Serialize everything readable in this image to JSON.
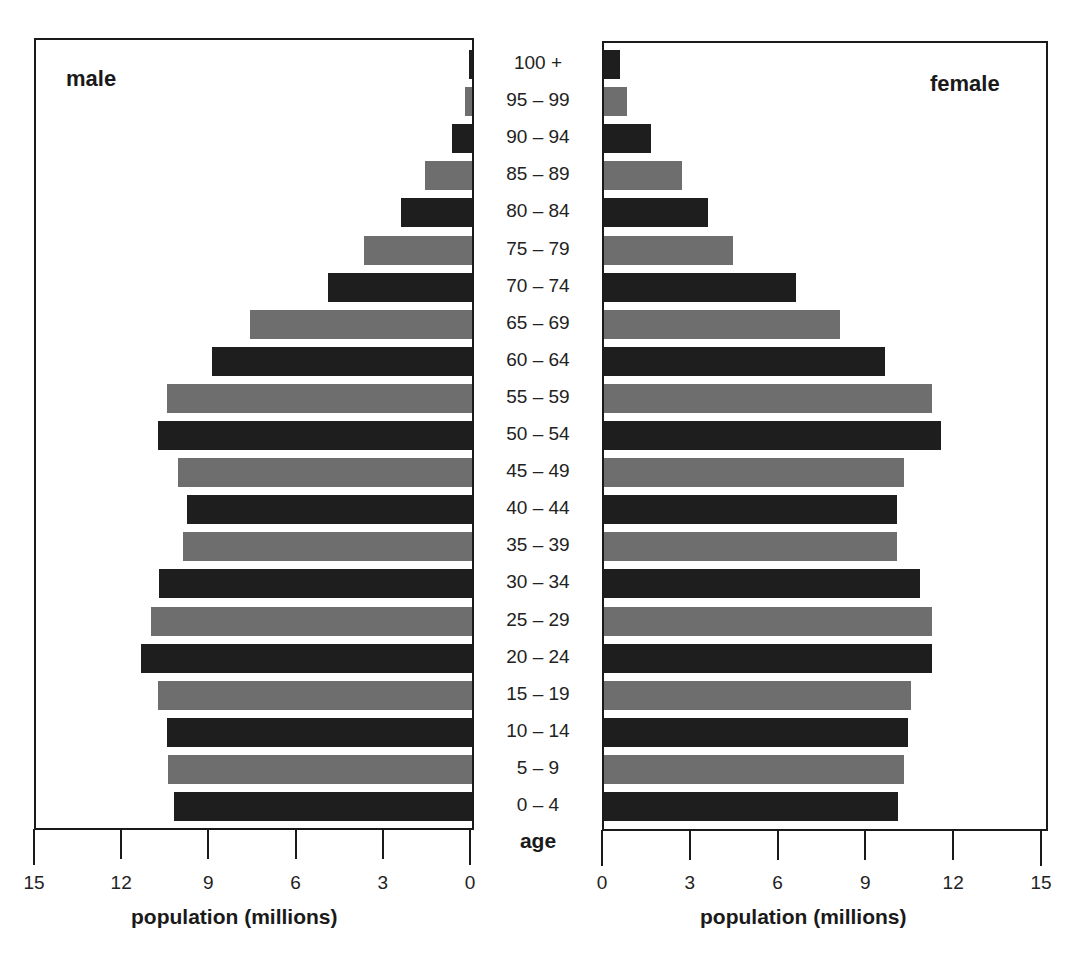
{
  "chart_data": {
    "type": "bar",
    "subtype": "population-pyramid",
    "title": "",
    "categories": [
      "100 +",
      "95 – 99",
      "90 – 94",
      "85 – 89",
      "80 – 84",
      "75 – 79",
      "70 – 74",
      "65 – 69",
      "60 – 64",
      "55 – 59",
      "50 – 54",
      "45 – 49",
      "40 – 44",
      "35 – 39",
      "30 – 34",
      "25 – 29",
      "20 – 24",
      "15 – 19",
      "10 – 14",
      "5 – 9",
      "0 – 4"
    ],
    "series": [
      {
        "name": "male",
        "values": [
          0.1,
          0.25,
          0.7,
          1.6,
          2.45,
          3.7,
          4.95,
          7.65,
          8.95,
          10.5,
          10.8,
          10.1,
          9.8,
          9.95,
          10.75,
          11.05,
          11.4,
          10.8,
          10.5,
          10.45,
          10.25
        ]
      },
      {
        "name": "female",
        "values": [
          0.55,
          0.8,
          1.6,
          2.65,
          3.55,
          4.4,
          6.55,
          8.05,
          9.6,
          11.2,
          11.5,
          10.25,
          10.0,
          10.0,
          10.8,
          11.2,
          11.2,
          10.5,
          10.4,
          10.25,
          10.05
        ]
      }
    ],
    "ylabel": "age",
    "xlabel": "population (millions)",
    "xlim": [
      0,
      15
    ],
    "xticks": [
      0,
      3,
      6,
      9,
      12,
      15
    ],
    "legend": "inline side labels: male (left), female (right)",
    "grid": false,
    "bar_colors": [
      "#1e1e1e",
      "#6e6e6e"
    ]
  },
  "labels": {
    "male": "male",
    "female": "female",
    "age": "age",
    "xlabel_left": "population (millions)",
    "xlabel_right": "population (millions)"
  },
  "ticks_left": [
    "15",
    "12",
    "9",
    "6",
    "3",
    "0"
  ],
  "ticks_right": [
    "0",
    "3",
    "6",
    "9",
    "12",
    "15"
  ]
}
